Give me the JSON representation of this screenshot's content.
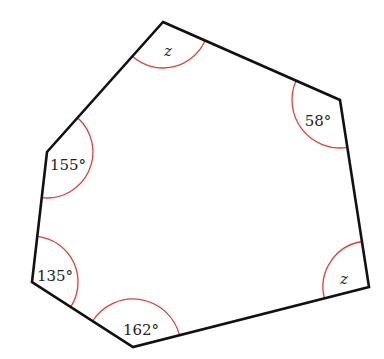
{
  "diagram": {
    "type": "polygon-angles",
    "shape": "hexagon",
    "colors": {
      "edge": "#111111",
      "arc": "#e0403a",
      "label": "#222222",
      "background": "#ffffff"
    },
    "vertices": [
      {
        "id": "top",
        "x": 163,
        "y": 22,
        "angle_label": "z",
        "label_x": 168,
        "label_y": 52,
        "is_variable": true,
        "arc_radius": 46
      },
      {
        "id": "upper-right",
        "x": 340,
        "y": 100,
        "angle_label": "58°",
        "label_x": 318,
        "label_y": 122,
        "is_variable": false,
        "arc_radius": 48
      },
      {
        "id": "lower-right",
        "x": 369,
        "y": 287,
        "angle_label": "z",
        "label_x": 344,
        "label_y": 280,
        "is_variable": true,
        "arc_radius": 46
      },
      {
        "id": "bottom",
        "x": 133,
        "y": 347,
        "angle_label": "162°",
        "label_x": 141,
        "label_y": 331,
        "is_variable": false,
        "arc_radius": 48
      },
      {
        "id": "lower-left",
        "x": 32,
        "y": 282,
        "angle_label": "135°",
        "label_x": 55,
        "label_y": 277,
        "is_variable": false,
        "arc_radius": 46
      },
      {
        "id": "upper-left",
        "x": 47,
        "y": 152,
        "angle_label": "155°",
        "label_x": 68,
        "label_y": 166,
        "is_variable": false,
        "arc_radius": 46
      }
    ]
  }
}
